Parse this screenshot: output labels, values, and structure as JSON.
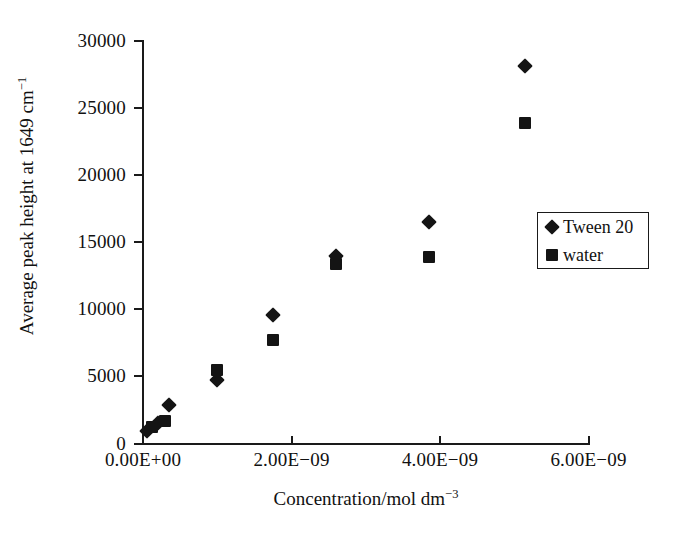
{
  "chart_data": {
    "type": "scatter",
    "title": "",
    "xlabel": "Concentration/mol dm",
    "xlabel_sup": "−3",
    "ylabel": "Average peak height at 1649 cm",
    "ylabel_sup": "−1",
    "xlim": [
      0,
      6e-09
    ],
    "ylim": [
      0,
      30000
    ],
    "grid": false,
    "legend_position": "right",
    "xticks": [
      {
        "value": 0,
        "label": "0.00E+00"
      },
      {
        "value": 2e-09,
        "label": "2.00E−09"
      },
      {
        "value": 4e-09,
        "label": "4.00E−09"
      },
      {
        "value": 6e-09,
        "label": "6.00E−09"
      }
    ],
    "yticks": [
      {
        "value": 0,
        "label": "0"
      },
      {
        "value": 5000,
        "label": "5000"
      },
      {
        "value": 10000,
        "label": "10000"
      },
      {
        "value": 15000,
        "label": "15000"
      },
      {
        "value": 20000,
        "label": "20000"
      },
      {
        "value": 25000,
        "label": "25000"
      },
      {
        "value": 30000,
        "label": "30000"
      }
    ],
    "series": [
      {
        "name": "Tween 20",
        "marker": "diamond",
        "color": "#141414",
        "points": [
          {
            "x": 5e-11,
            "y": 900
          },
          {
            "x": 2e-10,
            "y": 1500
          },
          {
            "x": 3.5e-10,
            "y": 2900
          },
          {
            "x": 1e-09,
            "y": 4700
          },
          {
            "x": 1.75e-09,
            "y": 9600
          },
          {
            "x": 2.6e-09,
            "y": 14000
          },
          {
            "x": 3.85e-09,
            "y": 16500
          },
          {
            "x": 5.15e-09,
            "y": 28100
          }
        ]
      },
      {
        "name": "water",
        "marker": "square",
        "color": "#141414",
        "points": [
          {
            "x": 1.2e-10,
            "y": 1200
          },
          {
            "x": 3e-10,
            "y": 1700
          },
          {
            "x": 1e-09,
            "y": 5500
          },
          {
            "x": 1.75e-09,
            "y": 7700
          },
          {
            "x": 2.6e-09,
            "y": 13400
          },
          {
            "x": 3.85e-09,
            "y": 13900
          },
          {
            "x": 5.15e-09,
            "y": 23900
          }
        ]
      }
    ]
  },
  "legend": {
    "entries": [
      {
        "label": "Tween 20",
        "marker": "diamond"
      },
      {
        "label": "water",
        "marker": "square"
      }
    ]
  }
}
